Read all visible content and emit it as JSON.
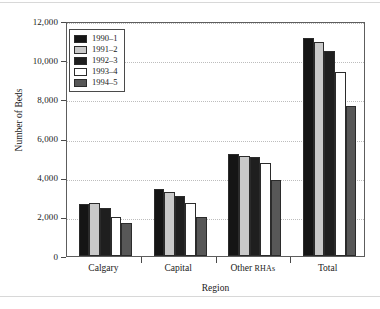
{
  "chart_data": {
    "type": "bar",
    "title": "",
    "xlabel": "Region",
    "ylabel": "Number of Beds",
    "categories": [
      "Calgary",
      "Capital",
      "Other RHAs",
      "Total"
    ],
    "ylim": [
      0,
      12000
    ],
    "ytick_values": [
      0,
      2000,
      4000,
      6000,
      8000,
      10000,
      12000
    ],
    "ytick_labels": [
      "0",
      "2,000",
      "4,000",
      "6,000",
      "8,000",
      "10,000",
      "12,000"
    ],
    "grid": true,
    "legend_position": "upper-left",
    "series": [
      {
        "name": "1990–1",
        "color": "#151515",
        "values": [
          2650,
          3430,
          5200,
          11120
        ]
      },
      {
        "name": "1991–2",
        "color": "#c9c9c9",
        "values": [
          2730,
          3280,
          5130,
          10950
        ]
      },
      {
        "name": "1992–3",
        "color": "#1f1f1f",
        "values": [
          2440,
          3090,
          5080,
          10450
        ]
      },
      {
        "name": "1993–4",
        "color": "#ffffff",
        "values": [
          1980,
          2700,
          4760,
          9400
        ]
      },
      {
        "name": "1994–5",
        "color": "#575757",
        "values": [
          1670,
          1980,
          3880,
          7640
        ]
      }
    ]
  },
  "axis": {
    "y_title": "Number of Beds",
    "x_title": "Region"
  },
  "xlabels": [
    {
      "main": "Calgary",
      "small": ""
    },
    {
      "main": "Capital",
      "small": ""
    },
    {
      "main": "Other ",
      "small": "RHAs"
    },
    {
      "main": "Total",
      "small": ""
    }
  ]
}
